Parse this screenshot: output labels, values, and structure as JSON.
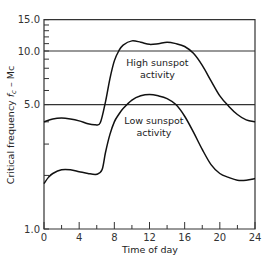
{
  "chart_data": {
    "type": "line",
    "title": "",
    "xlabel": "Time of day",
    "ylabel": "Critical frequency f_c — Mc",
    "ylabel_parts": {
      "main": "Critical frequency ",
      "f": "f",
      "sub": "c",
      "unit": " – Mc"
    },
    "y_scale": "log",
    "xlim": [
      0,
      24
    ],
    "ylim": [
      1.0,
      15.0
    ],
    "x_ticks": [
      0,
      4,
      8,
      12,
      16,
      20,
      24
    ],
    "x_tick_labels": [
      "0",
      "4",
      "8",
      "12",
      "16",
      "20",
      "24"
    ],
    "y_tick_labels": [
      {
        "value": 1.0,
        "label": "1.0"
      },
      {
        "value": 5.0,
        "label": "5.0"
      },
      {
        "value": 10.0,
        "label": "10.0"
      },
      {
        "value": 15.0,
        "label": "15.0"
      }
    ],
    "reference_lines": [
      5.0,
      10.0
    ],
    "grid": false,
    "series": [
      {
        "name": "High sunspot activity",
        "x": [
          0,
          1,
          2,
          3,
          4,
          5,
          5.8,
          6.4,
          7,
          7.5,
          8,
          8.5,
          9,
          10,
          11,
          12,
          13,
          14,
          15,
          16,
          17,
          18,
          19,
          20,
          21,
          22,
          23,
          24
        ],
        "values": [
          4.0,
          4.15,
          4.2,
          4.15,
          4.05,
          3.9,
          3.85,
          3.95,
          5.2,
          7.0,
          8.8,
          10.0,
          10.8,
          11.4,
          11.2,
          10.9,
          11.0,
          11.2,
          11.0,
          10.6,
          9.7,
          8.3,
          6.8,
          5.6,
          4.9,
          4.4,
          4.1,
          4.0
        ]
      },
      {
        "name": "Low sunspot activity",
        "x": [
          0,
          0.5,
          1,
          2,
          3,
          4,
          5,
          6,
          6.6,
          7,
          7.5,
          8,
          8.5,
          9,
          10,
          11,
          12,
          13,
          14,
          15,
          16,
          17,
          18,
          19,
          20,
          21,
          22,
          23,
          24
        ],
        "values": [
          1.8,
          1.95,
          2.05,
          2.15,
          2.15,
          2.1,
          2.05,
          2.03,
          2.15,
          2.7,
          3.4,
          4.0,
          4.4,
          4.75,
          5.3,
          5.6,
          5.7,
          5.6,
          5.4,
          5.0,
          4.3,
          3.5,
          2.8,
          2.3,
          2.05,
          1.95,
          1.88,
          1.88,
          1.92
        ]
      }
    ],
    "annotations": [
      {
        "text": [
          "High sunspot",
          "activity"
        ],
        "x": 12.9,
        "y": 8.2
      },
      {
        "text": [
          "Low sunspot",
          "activity"
        ],
        "x": 12.5,
        "y": 3.9
      }
    ]
  }
}
